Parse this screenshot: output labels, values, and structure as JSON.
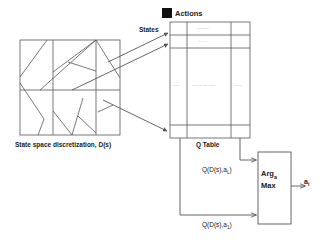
{
  "figure": {
    "background": "#ffffff",
    "line_color": "#555555",
    "text_color": "#1a1a1a"
  },
  "labels": {
    "actions": "Actions",
    "states": "States",
    "q_table": "Q Table",
    "state_space": "State space discretization, D(s)",
    "argmax_line1": "Arg",
    "argmax_sub1": "a",
    "argmax_line2": "Max",
    "q_top": "Q(D(s),a",
    "q_top_sub": "L",
    "q_top_close": ")",
    "q_bottom": "Q(D(s),a",
    "q_bottom_sub": "1",
    "q_bottom_close": ")",
    "output": "a",
    "output_sub": "i"
  },
  "q_table": {
    "columns": 3,
    "rows": 5,
    "cell_placeholder_row1": "–––––",
    "cell_placeholder_row2": "– – –",
    "cell_mid_left": "–––",
    "cell_mid_center": "––– – –– –––",
    "cell_mid_right": "–––"
  },
  "colors": {
    "actions_swatch": "#111111",
    "stroke": "#555555",
    "cell_text": "#8a8a8a"
  }
}
